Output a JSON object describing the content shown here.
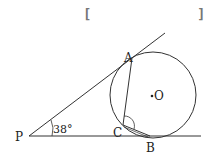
{
  "diagram": {
    "answer_bracket_open": "[",
    "answer_bracket_close": "]",
    "points": {
      "P": "P",
      "A": "A",
      "B": "B",
      "C": "C",
      "O": "O"
    },
    "angle_label": "38°",
    "stroke_color": "#333333",
    "bracket_color": "#777777"
  }
}
